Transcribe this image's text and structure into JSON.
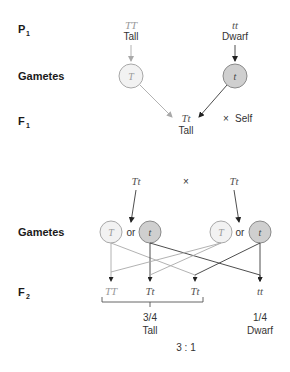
{
  "row_labels": {
    "p1": {
      "main": "P",
      "sub": "1"
    },
    "gametes_1": "Gametes",
    "f1": {
      "main": "F",
      "sub": "1"
    },
    "gametes_2": "Gametes",
    "f2": {
      "main": "F",
      "sub": "2"
    }
  },
  "parents": {
    "tall": {
      "genotype": "TT",
      "phenotype": "Tall"
    },
    "dwarf": {
      "genotype": "tt",
      "phenotype": "Dwarf"
    }
  },
  "gametes_p1": {
    "dominant": "T",
    "recessive": "t"
  },
  "f1": {
    "genotype": "Tt",
    "phenotype": "Tall",
    "cross_symbol": "×",
    "cross_label": "Self"
  },
  "f1_cross": {
    "left_parent": "Tt",
    "cross_symbol": "×",
    "right_parent": "Tt"
  },
  "gametes_f1": {
    "left": {
      "dominant": "T",
      "or": "or",
      "recessive": "t"
    },
    "right": {
      "dominant": "T",
      "or": "or",
      "recessive": "t"
    }
  },
  "f2": {
    "offspring": [
      "TT",
      "Tt",
      "Tt",
      "tt"
    ],
    "tall_group": {
      "fraction": "3/4",
      "phenotype": "Tall"
    },
    "dwarf_group": {
      "fraction": "1/4",
      "phenotype": "Dwarf"
    },
    "ratio": "3 : 1"
  },
  "colors": {
    "dominant_allele": "#9a9a9a",
    "recessive_circle_fill": "#cfcfcf",
    "dominant_circle_fill": "#f2f2f2",
    "dark_line": "#3a3a3a",
    "light_line": "#a9a9a9"
  }
}
